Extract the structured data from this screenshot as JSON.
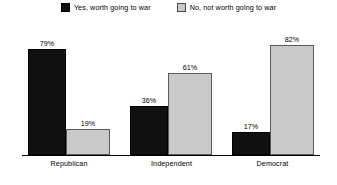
{
  "chart_data": {
    "type": "bar",
    "title": "",
    "subtitle": "",
    "xlabel": "",
    "ylabel": "",
    "ylim": [
      0,
      100
    ],
    "grid": false,
    "legend_position": "top-center",
    "value_suffix": "%",
    "categories": [
      "Republican",
      "Independent",
      "Democrat"
    ],
    "series": [
      {
        "name": "Yes, worth going to war",
        "key": "yes",
        "color": "#111111",
        "values": [
          79,
          36,
          17
        ],
        "labels": [
          "79%",
          "36%",
          "17%"
        ]
      },
      {
        "name": "No, not worth going to war",
        "key": "no",
        "color": "#c9c9c9",
        "values": [
          19,
          61,
          82
        ],
        "labels": [
          "19%",
          "61%",
          "82%"
        ]
      }
    ]
  },
  "legend": {
    "items": [
      {
        "label": "Yes, worth going to war",
        "swatch": "legend-swatch-dark"
      },
      {
        "label": "No, not worth going to war",
        "swatch": "legend-swatch-light"
      }
    ]
  },
  "axis": {
    "categories": [
      "Republican",
      "Independent",
      "Democrat"
    ]
  },
  "bars": {
    "g0": {
      "yes": {
        "label": "79%",
        "height_pct": 79
      },
      "no": {
        "label": "19%",
        "height_pct": 19
      }
    },
    "g1": {
      "yes": {
        "label": "36%",
        "height_pct": 36
      },
      "no": {
        "label": "61%",
        "height_pct": 61
      }
    },
    "g2": {
      "yes": {
        "label": "17%",
        "height_pct": 17
      },
      "no": {
        "label": "82%",
        "height_pct": 82
      }
    }
  }
}
